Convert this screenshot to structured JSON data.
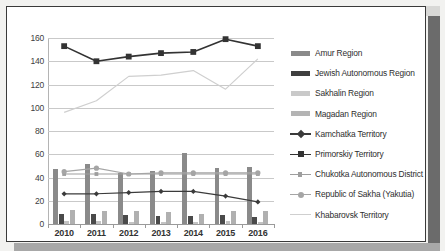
{
  "chart_data": {
    "type": "bar",
    "title": "",
    "xlabel": "",
    "ylabel": "",
    "categories": [
      "2010",
      "2011",
      "2012",
      "2013",
      "2014",
      "2015",
      "2016"
    ],
    "ylim": [
      0,
      160
    ],
    "ytick_step": 20,
    "yticks": [
      "0",
      "20",
      "40",
      "60",
      "80",
      "100",
      "120",
      "140",
      "160"
    ],
    "grid": true,
    "legend_position": "right",
    "series": [
      {
        "name": "Amur Region",
        "kind": "bar",
        "color": "#8a8a8a",
        "values": [
          47,
          52,
          44,
          46,
          61,
          48,
          49
        ]
      },
      {
        "name": "Jewish Autonomous Region",
        "kind": "bar",
        "color": "#4a4a4a",
        "values": [
          9,
          9,
          8,
          7,
          7,
          8,
          6
        ]
      },
      {
        "name": "Sakhalin Region",
        "kind": "bar",
        "color": "#c4c4c4",
        "values": [
          3,
          3,
          2,
          2,
          2,
          3,
          2
        ]
      },
      {
        "name": "Magadan Region",
        "kind": "bar",
        "color": "#b0b0b0",
        "values": [
          12,
          11,
          11,
          10,
          9,
          11,
          11
        ]
      },
      {
        "name": "Kamchatka Territory",
        "kind": "line",
        "color": "#3b3b3b",
        "marker": "diamond",
        "values": [
          26,
          26,
          27,
          28,
          28,
          24,
          19
        ]
      },
      {
        "name": "Primorskiy Territory",
        "kind": "line",
        "color": "#333333",
        "marker": "square",
        "values": [
          153,
          140,
          144,
          147,
          148,
          159,
          153
        ]
      },
      {
        "name": "Chukotka Autonomous District",
        "kind": "line",
        "color": "#9e9e9e",
        "marker": "square-small",
        "values": [
          43,
          43,
          43,
          43,
          43,
          43,
          43
        ]
      },
      {
        "name": "Republic of Sakha (Yakutia)",
        "kind": "line",
        "color": "#a5a5a5",
        "marker": "circle",
        "values": [
          45,
          48,
          43,
          44,
          44,
          44,
          44
        ]
      },
      {
        "name": "Khabarovsk Territory",
        "kind": "line",
        "color": "#cfcfcf",
        "marker": "none",
        "values": [
          96,
          106,
          127,
          128,
          132,
          116,
          142
        ]
      }
    ]
  },
  "legend": {
    "items": [
      {
        "label": "Amur Region",
        "key": "bar",
        "color": "#8a8a8a"
      },
      {
        "label": "Jewish Autonomous Region",
        "key": "bar",
        "color": "#3f3f3f"
      },
      {
        "label": "Sakhalin Region",
        "key": "bar",
        "color": "#c9c9c9"
      },
      {
        "label": "Magadan Region",
        "key": "bar",
        "color": "#b4b4b4"
      },
      {
        "label": "Kamchatka Territory",
        "key": "line-diamond",
        "color": "#3b3b3b"
      },
      {
        "label": "Primorskiy Territory",
        "key": "line-square",
        "color": "#333333"
      },
      {
        "label": "Chukotka Autonomous District",
        "key": "line-square-small",
        "color": "#9e9e9e"
      },
      {
        "label": "Republic of Sakha (Yakutia)",
        "key": "line-circle",
        "color": "#a5a5a5"
      },
      {
        "label": "Khabarovsk Territory",
        "key": "line-plain",
        "color": "#cfcfcf"
      }
    ]
  }
}
